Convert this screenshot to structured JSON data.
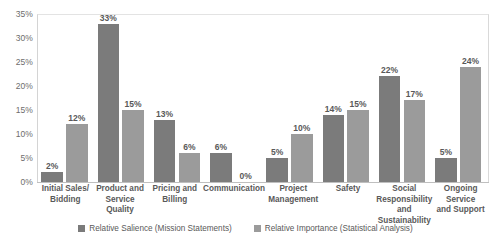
{
  "chart_data": {
    "type": "bar",
    "title": "",
    "subtitle": "",
    "xlabel": "",
    "ylabel": "",
    "ylim": [
      0,
      35
    ],
    "ytick_labels": [
      "35%",
      "30%",
      "25%",
      "20%",
      "15%",
      "10%",
      "5%",
      "0%"
    ],
    "ytick_values": [
      35,
      30,
      25,
      20,
      15,
      10,
      5,
      0
    ],
    "grid": false,
    "legend_position": "bottom-center",
    "categories": [
      "Initial Sales/ Bidding",
      "Product and Service Quality",
      "Pricing and Billing",
      "Communication",
      "Project Management",
      "Safety",
      "Social Responsibility and Sustainability",
      "Ongoing Service and Support"
    ],
    "category_lines": [
      [
        "Initial Sales/",
        "Bidding"
      ],
      [
        "Product and",
        "Service Quality"
      ],
      [
        "Pricing and",
        "Billing"
      ],
      [
        "Communication"
      ],
      [
        "Project",
        "Management"
      ],
      [
        "Safety"
      ],
      [
        "Social",
        "Responsibility",
        "and Sustainability"
      ],
      [
        "Ongoing Service",
        "and Support"
      ]
    ],
    "series": [
      {
        "name": "Relative Salience (Mission Statements)",
        "color": "#7b7b7b",
        "values": [
          2,
          33,
          13,
          6,
          5,
          14,
          22,
          5
        ],
        "labels": [
          "2%",
          "33%",
          "13%",
          "6%",
          "5%",
          "14%",
          "22%",
          "5%"
        ]
      },
      {
        "name": "Relative Importance (Statistical Analysis)",
        "color": "#9b9b9b",
        "values": [
          12,
          15,
          6,
          0,
          10,
          15,
          17,
          24
        ],
        "labels": [
          "12%",
          "15%",
          "6%",
          "0%",
          "10%",
          "15%",
          "17%",
          "24%"
        ]
      }
    ]
  },
  "legend": {
    "items": [
      {
        "label": "Relative Salience (Mission Statements)",
        "color": "#7b7b7b"
      },
      {
        "label": "Relative Importance (Statistical Analysis)",
        "color": "#9b9b9b"
      }
    ]
  }
}
